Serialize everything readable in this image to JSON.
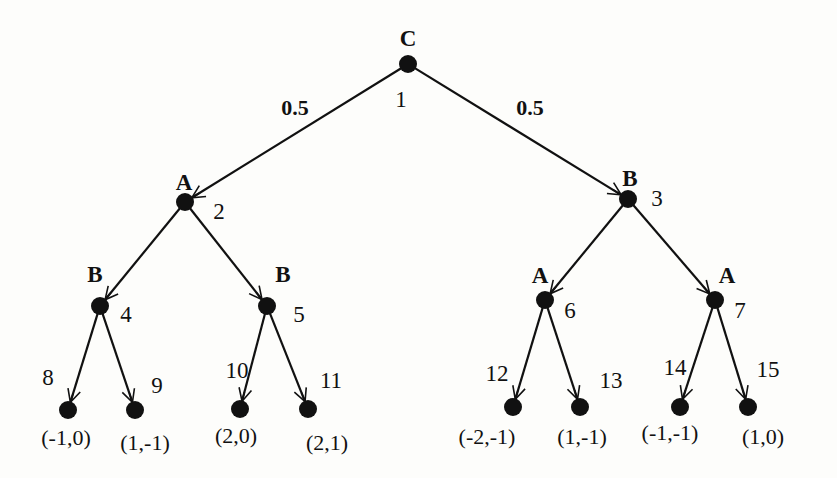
{
  "diagram": {
    "type": "extensive-form game tree",
    "nodes": [
      {
        "id": 1,
        "player": "C",
        "x": 408,
        "y": 64
      },
      {
        "id": 2,
        "player": "A",
        "x": 185,
        "y": 202
      },
      {
        "id": 3,
        "player": "B",
        "x": 628,
        "y": 199
      },
      {
        "id": 4,
        "player": "B",
        "x": 100,
        "y": 306
      },
      {
        "id": 5,
        "player": "B",
        "x": 267,
        "y": 306
      },
      {
        "id": 6,
        "player": "A",
        "x": 545,
        "y": 300
      },
      {
        "id": 7,
        "player": "A",
        "x": 715,
        "y": 300
      },
      {
        "id": 8,
        "payoff": "(-1,0)",
        "x": 68,
        "y": 410
      },
      {
        "id": 9,
        "payoff": "(1,-1)",
        "x": 135,
        "y": 410
      },
      {
        "id": 10,
        "payoff": "(2,0)",
        "x": 240,
        "y": 409
      },
      {
        "id": 11,
        "payoff": "(2,1)",
        "x": 308,
        "y": 409
      },
      {
        "id": 12,
        "payoff": "(-2,-1)",
        "x": 513,
        "y": 407
      },
      {
        "id": 13,
        "payoff": "(1,-1)",
        "x": 580,
        "y": 407
      },
      {
        "id": 14,
        "payoff": "(-1,-1)",
        "x": 680,
        "y": 407
      },
      {
        "id": 15,
        "payoff": "(1,0)",
        "x": 748,
        "y": 407
      }
    ],
    "edges": [
      {
        "from": 1,
        "to": 2,
        "prob": "0.5"
      },
      {
        "from": 1,
        "to": 3,
        "prob": "0.5"
      },
      {
        "from": 2,
        "to": 4
      },
      {
        "from": 2,
        "to": 5
      },
      {
        "from": 3,
        "to": 6
      },
      {
        "from": 3,
        "to": 7
      },
      {
        "from": 4,
        "to": 8
      },
      {
        "from": 4,
        "to": 9
      },
      {
        "from": 5,
        "to": 10
      },
      {
        "from": 5,
        "to": 11
      },
      {
        "from": 6,
        "to": 12
      },
      {
        "from": 6,
        "to": 13
      },
      {
        "from": 7,
        "to": 14
      },
      {
        "from": 7,
        "to": 15
      }
    ],
    "labels": {
      "player_1": "C",
      "player_2": "A",
      "player_3": "B",
      "player_4": "B",
      "player_5": "B",
      "player_6": "A",
      "player_7": "A",
      "num_1": "1",
      "num_2": "2",
      "num_3": "3",
      "num_4": "4",
      "num_5": "5",
      "num_6": "6",
      "num_7": "7",
      "num_8": "8",
      "num_9": "9",
      "num_10": "10",
      "num_11": "11",
      "num_12": "12",
      "num_13": "13",
      "num_14": "14",
      "num_15": "15",
      "prob_left": "0.5",
      "prob_right": "0.5",
      "payoff_8": "(-1,0)",
      "payoff_9": "(1,-1)",
      "payoff_10": "(2,0)",
      "payoff_11": "(2,1)",
      "payoff_12": "(-2,-1)",
      "payoff_13": "(1,-1)",
      "payoff_14": "(-1,-1)",
      "payoff_15": "(1,0)"
    }
  }
}
